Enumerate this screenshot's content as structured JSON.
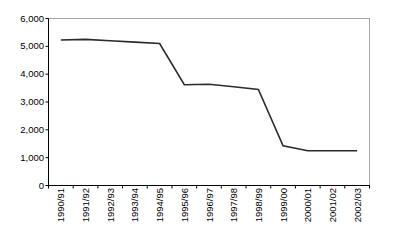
{
  "chart_data": {
    "type": "line",
    "title": "",
    "subtitle": "",
    "xlabel": "",
    "ylabel": "",
    "categories": [
      "1990/91",
      "1991/92",
      "1992/93",
      "1993/94",
      "1994/95",
      "1995/96",
      "1996/97",
      "1997/98",
      "1998/99",
      "1999/00",
      "2000/01",
      "2001/02",
      "2002/03"
    ],
    "values": [
      5230,
      5250,
      5200,
      5150,
      5100,
      3620,
      3640,
      3550,
      3450,
      1430,
      1250,
      1250,
      1250
    ],
    "series": [
      {
        "name": "",
        "values": [
          5230,
          5250,
          5200,
          5150,
          5100,
          3620,
          3640,
          3550,
          3450,
          1430,
          1250,
          1250,
          1250
        ]
      }
    ],
    "ylim": [
      0,
      6000
    ],
    "ytick_values": [
      0,
      1000,
      2000,
      3000,
      4000,
      5000,
      6000
    ],
    "ytick_labels": [
      "0",
      "1,000",
      "2,000",
      "3,000",
      "4,000",
      "5,000",
      "6,000"
    ],
    "grid": false,
    "legend": false,
    "legend_position": "none",
    "annotations": [],
    "xtick_rotation": 90,
    "colors": {
      "line": "#2b2b2b",
      "axis": "#000000",
      "frame": "#a8a8a8",
      "background": "#ffffff",
      "text": "#000000"
    }
  }
}
